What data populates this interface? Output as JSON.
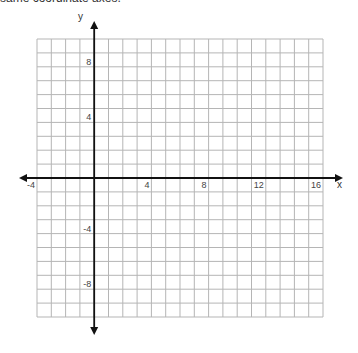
{
  "caption": "same coordinate axes.",
  "graph": {
    "x_axis_label": "x",
    "y_axis_label": "y",
    "x_range": [
      -4,
      16
    ],
    "y_range": [
      -10,
      10
    ],
    "grid_step": 1,
    "x_tick_labels": [
      {
        "value": -4,
        "text": "-4"
      },
      {
        "value": 4,
        "text": "4"
      },
      {
        "value": 8,
        "text": "8"
      },
      {
        "value": 12,
        "text": "12"
      },
      {
        "value": 16,
        "text": "16"
      }
    ],
    "y_tick_labels": [
      {
        "value": 8,
        "text": "8"
      },
      {
        "value": 4,
        "text": "4"
      },
      {
        "value": -4,
        "text": "-4"
      },
      {
        "value": -8,
        "text": "-8"
      }
    ],
    "colors": {
      "grid": "#b5b5b5",
      "axis": "#111111",
      "label": "#444444"
    }
  }
}
